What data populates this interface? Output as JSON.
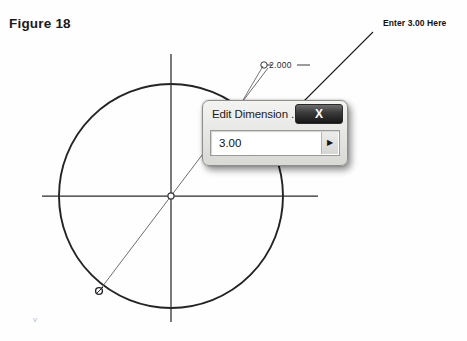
{
  "figure": {
    "caption": "Figure 18"
  },
  "annotation": {
    "callout_label": "Enter 3.00 Here",
    "arrow_from": [
      373,
      32
    ],
    "arrow_to": [
      253,
      152
    ]
  },
  "sketch": {
    "dimension_label": "2.000",
    "circle_center": [
      171,
      196
    ],
    "circle_radius": 112,
    "horizontal_axis": [
      42,
      196,
      318,
      196
    ],
    "vertical_axis": [
      171,
      54,
      171,
      322
    ],
    "radius_line_from": [
      171,
      196
    ],
    "radius_line_to": [
      99,
      291
    ],
    "point_marker": [
      99,
      291
    ],
    "center_marker": [
      171,
      196
    ],
    "dimension_leader_from": [
      263,
      66
    ],
    "dimension_leader_to": [
      236,
      112
    ],
    "line_color": "#232323",
    "thin_line_color": "#6a6a70",
    "stray_mark": "v"
  },
  "dialog": {
    "title": "Edit Dimension ...",
    "close_label": "X",
    "close_icon": "close-icon",
    "input_value": "3.00",
    "input_placeholder": "3.00",
    "dropdown_icon": "triangle-right-icon",
    "dropdown_glyph": "▶"
  },
  "colors": {
    "page_background": "#fefefe",
    "ink": "#1a1a1a",
    "dialog_titlebar_dark": "#161616",
    "dialog_face": "#e8e8e6"
  }
}
